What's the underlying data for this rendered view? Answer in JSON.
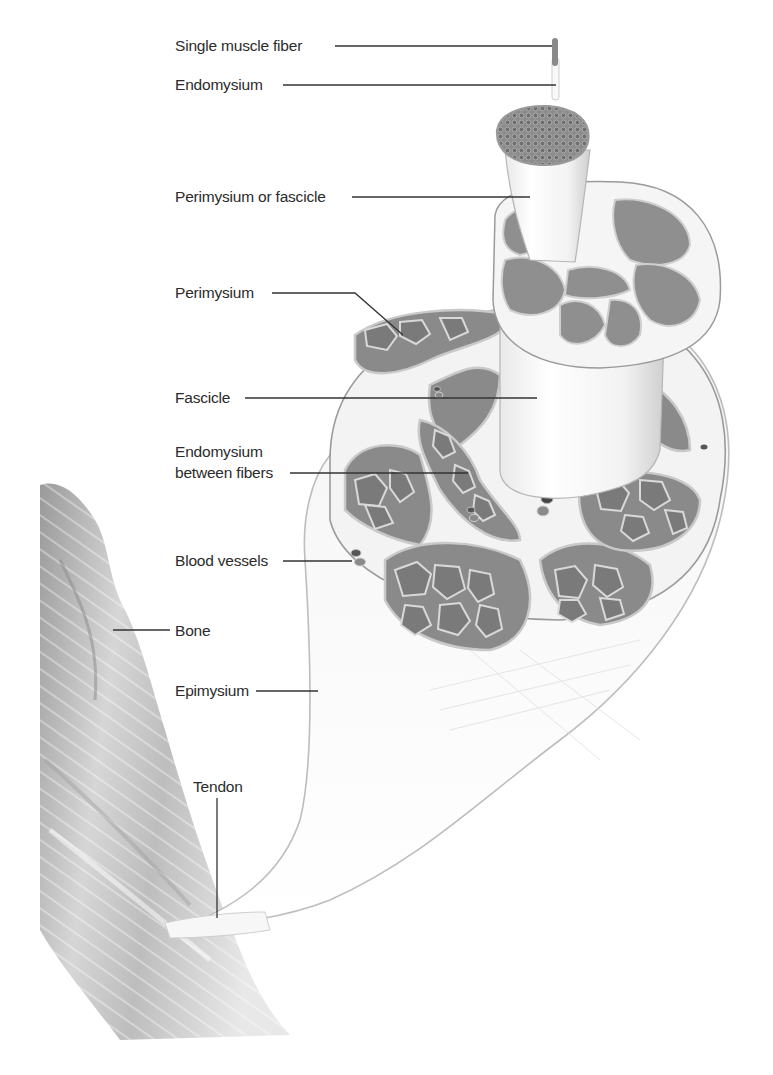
{
  "figure": {
    "labels": {
      "single_muscle_fiber": "Single muscle fiber",
      "endomysium_top": "Endomysium",
      "perimysium_or_fascicle": "Perimysium or fascicle",
      "perimysium": "Perimysium",
      "fascicle": "Fascicle",
      "endomysium_between_line1": "Endomysium",
      "endomysium_between_line2": "between fibers",
      "blood_vessels": "Blood vessels",
      "bone": "Bone",
      "epimysium": "Epimysium",
      "tendon": "Tendon"
    },
    "colors": {
      "background": "#ffffff",
      "muscle_tissue": "#7a7a7a",
      "connective_tissue": "#f2f2f2",
      "leader_lines": "#333333",
      "text": "#2b2b2b"
    }
  }
}
